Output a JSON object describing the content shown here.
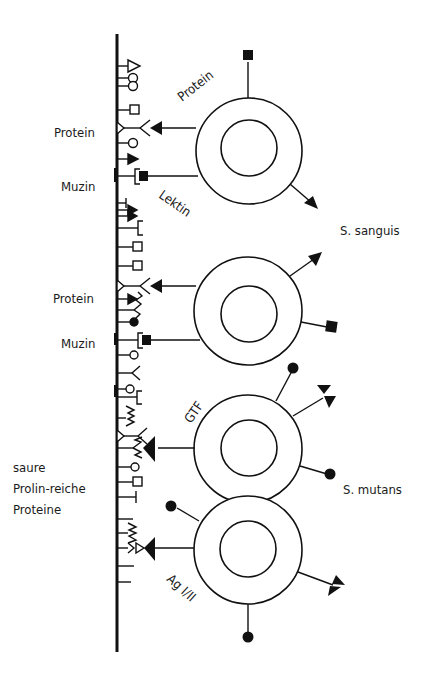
{
  "figure": {
    "surface_labels": {
      "protein_top": "Protein",
      "muzin_top": "Muzin",
      "protein_mid": "Protein",
      "muzin_mid": "Muzin",
      "saure_line1": "saure",
      "saure_line2": "Prolin-reiche",
      "saure_line3": "Proteine"
    },
    "bacterium_labels": {
      "protein_adhesin": "Protein",
      "lektin": "Lektin",
      "gtf": "GTF",
      "ag": "Ag I/II"
    },
    "species_labels": {
      "sanguis": "S. sanguis",
      "mutans": "S. mutans"
    },
    "colors": {
      "ink": "#111111",
      "background": "#ffffff"
    }
  }
}
